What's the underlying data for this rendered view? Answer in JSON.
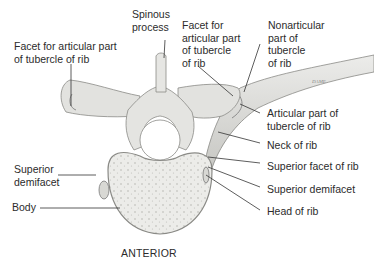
{
  "diagram": {
    "orientation_label": "ANTERIOR",
    "signature": "DAME",
    "labels": {
      "spinous_process": [
        "Spinous",
        "process"
      ],
      "facet_left": [
        "Facet for articular part",
        "of tubercle of rib"
      ],
      "facet_right": [
        "Facet for",
        "articular part",
        "of tubercle",
        "of rib"
      ],
      "nonarticular": [
        "Nonarticular",
        "part of",
        "tubercle",
        "of rib"
      ],
      "articular_part": [
        "Articular part of",
        "tubercle of rib"
      ],
      "neck_of_rib": [
        "Neck of rib"
      ],
      "superior_facet_of_rib": [
        "Superior facet of rib"
      ],
      "superior_demifacet_right": [
        "Superior demifacet"
      ],
      "head_of_rib": [
        "Head of rib"
      ],
      "superior_demifacet_left": [
        "Superior",
        "demifacet"
      ],
      "body": [
        "Body"
      ]
    },
    "colors": {
      "bone_fill": "#e6e6e3",
      "bone_shade": "#c9c9c5",
      "outline": "#8a8a86",
      "leader_line": "#333333",
      "text": "#2b2b2b"
    }
  }
}
